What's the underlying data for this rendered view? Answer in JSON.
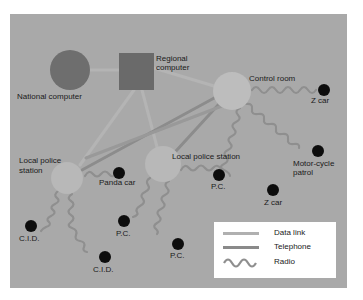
{
  "diagram": {
    "colors": {
      "page_background": "#ffffff",
      "panel_background": "#a9a9a9",
      "data_link": "#b0b0b0",
      "telephone": "#8a8a8a",
      "radio": "#8f8f8f",
      "national_computer": "#6e6e6e",
      "regional_computer": "#6a6a6a",
      "control_room": "#bdbdbd",
      "local_station": "#b8b8b8",
      "unit": "#0d0d0d"
    },
    "nodes": {
      "national_computer": {
        "label": "National computer"
      },
      "regional_computer": {
        "label_line1": "Regional",
        "label_line2": "computer"
      },
      "control_room": {
        "label": "Control room"
      },
      "local_station_left": {
        "label_line1": "Local police",
        "label_line2": "station"
      },
      "local_station_center": {
        "label": "Local police station"
      }
    },
    "units": [
      {
        "id": "z_car_1",
        "label": "Z car"
      },
      {
        "id": "motorcycle",
        "label_line1": "Motor-cycle",
        "label_line2": "patrol"
      },
      {
        "id": "z_car_2",
        "label": "Z car"
      },
      {
        "id": "panda_car",
        "label": "Panda car"
      },
      {
        "id": "pc_right",
        "label": "P.C."
      },
      {
        "id": "pc_left",
        "label": "P.C."
      },
      {
        "id": "pc_bottom",
        "label": "P.C."
      },
      {
        "id": "cid_left",
        "label": "C.I.D."
      },
      {
        "id": "cid_bottom",
        "label": "C.I.D."
      }
    ],
    "legend": {
      "items": [
        {
          "type": "data_link",
          "label": "Data link"
        },
        {
          "type": "telephone",
          "label": "Telephone"
        },
        {
          "type": "radio",
          "label": "Radio"
        }
      ]
    }
  }
}
